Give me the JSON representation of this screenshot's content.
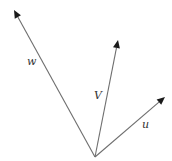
{
  "diagram": {
    "type": "vector-diagram",
    "origin": {
      "x": 95,
      "y": 157
    },
    "colors": {
      "line": "#6e6e6e",
      "arrowhead": "#1a1a1a",
      "label": "#333333",
      "background": "#ffffff"
    },
    "vectors": [
      {
        "name": "w",
        "label": "w",
        "tip": {
          "x": 14,
          "y": 10
        },
        "label_pos": {
          "x": 27,
          "y": 65
        }
      },
      {
        "name": "v",
        "label": "V",
        "tip": {
          "x": 118,
          "y": 40
        },
        "label_pos": {
          "x": 94,
          "y": 99
        }
      },
      {
        "name": "u",
        "label": "u",
        "tip": {
          "x": 165,
          "y": 97
        },
        "label_pos": {
          "x": 142,
          "y": 128
        }
      }
    ]
  }
}
